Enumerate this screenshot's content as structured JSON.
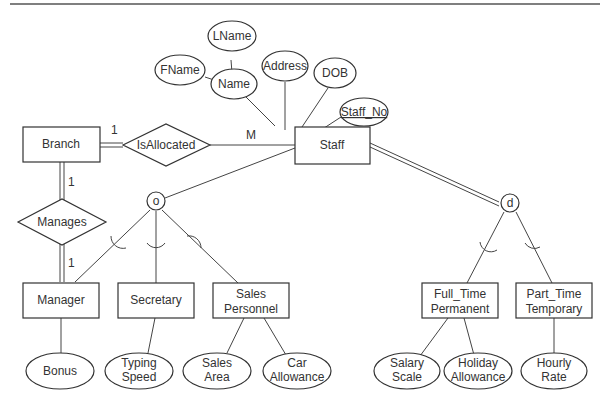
{
  "diagram": {
    "type": "EER diagram",
    "entities": {
      "branch": "Branch",
      "staff": "Staff",
      "manager": "Manager",
      "secretary": "Secretary",
      "sales_personnel": [
        "Sales",
        "Personnel"
      ],
      "full_time": [
        "Full_Time",
        "Permanent"
      ],
      "part_time": [
        "Part_Time",
        "Temporary"
      ]
    },
    "relationships": {
      "is_allocated": "IsAllocated",
      "manages": "Manages"
    },
    "attributes": {
      "lname": "LName",
      "fname": "FName",
      "name": "Name",
      "address": "Address",
      "dob": "DOB",
      "staff_no": "Staff_No",
      "bonus": "Bonus",
      "typing_speed": [
        "Typing",
        "Speed"
      ],
      "sales_area": [
        "Sales",
        "Area"
      ],
      "car_allowance": [
        "Car",
        "Allowance"
      ],
      "salary_scale": [
        "Salary",
        "Scale"
      ],
      "holiday_allowance": [
        "Holiday",
        "Allowance"
      ],
      "hourly_rate": [
        "Hourly",
        "Rate"
      ]
    },
    "cardinalities": {
      "branch_isallocated": "1",
      "staff_isallocated": "M",
      "branch_manages": "1",
      "manager_manages": "1"
    },
    "specializations": {
      "overlapping": "o",
      "disjoint": "d"
    }
  }
}
